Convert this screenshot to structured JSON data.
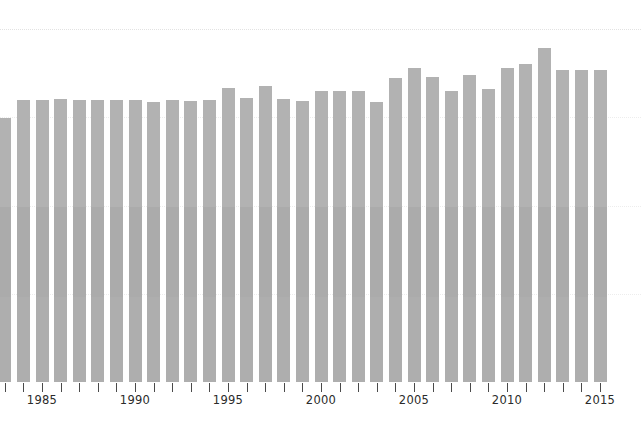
{
  "chart_data": {
    "type": "bar",
    "title": "",
    "subtitle": "",
    "xlabel": "",
    "ylabel": "",
    "grid": true,
    "legend": null,
    "legend_position": "none",
    "xlim": [
      1982,
      2016
    ],
    "ylim": [
      0,
      4
    ],
    "y_gridlines": [
      1,
      2,
      3,
      4
    ],
    "bar_color": "#b2b2b2",
    "gridline_color": "#e2e2e2",
    "axis_color": "#4a4a4a",
    "label_color": "#2b2b2b",
    "x_tick_labels": [
      "1985",
      "1990",
      "1995",
      "2000",
      "2005",
      "2010",
      "2015"
    ],
    "x_tick_years": [
      1985,
      1990,
      1995,
      2000,
      2005,
      2010,
      2015
    ],
    "categories": [
      1983,
      1984,
      1985,
      1986,
      1987,
      1988,
      1989,
      1990,
      1991,
      1992,
      1993,
      1994,
      1995,
      1996,
      1997,
      1998,
      1999,
      2000,
      2001,
      2002,
      2003,
      2004,
      2005,
      2006,
      2007,
      2008,
      2009,
      2010,
      2011,
      2012,
      2013,
      2014,
      2015
    ],
    "values": [
      2.93,
      3.12,
      3.12,
      3.13,
      3.12,
      3.12,
      3.12,
      3.12,
      3.1,
      3.12,
      3.11,
      3.12,
      3.25,
      3.14,
      3.27,
      3.13,
      3.11,
      3.22,
      3.22,
      3.22,
      3.1,
      3.37,
      3.48,
      3.38,
      3.22,
      3.4,
      3.24,
      3.48,
      3.52,
      3.68,
      3.46,
      3.46,
      3.46
    ],
    "bar_tops_px": [
      118,
      100,
      100,
      99,
      100,
      100,
      100,
      100,
      102,
      100,
      101,
      100,
      88,
      98,
      86,
      99,
      101,
      91,
      91,
      91,
      102,
      78,
      68,
      77,
      91,
      75,
      89,
      68,
      64,
      48,
      70,
      70,
      70
    ],
    "baseline_px": 382
  },
  "axis": {
    "tick_count": 33,
    "tick_mark_name": "x-axis-tick"
  }
}
